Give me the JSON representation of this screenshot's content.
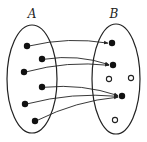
{
  "diagram": {
    "type": "function-mapping",
    "sets": [
      {
        "id": "A",
        "label": "A",
        "label_pos": [
          32,
          18
        ],
        "ellipse": {
          "cx": 32,
          "cy": 79,
          "rx": 25,
          "ry": 54
        }
      },
      {
        "id": "B",
        "label": "B",
        "label_pos": [
          114,
          18
        ],
        "ellipse": {
          "cx": 116,
          "cy": 79,
          "rx": 24,
          "ry": 55
        }
      }
    ],
    "domain_points": [
      {
        "id": "a1",
        "x": 27,
        "y": 46
      },
      {
        "id": "a2",
        "x": 42,
        "y": 59
      },
      {
        "id": "a3",
        "x": 24,
        "y": 72
      },
      {
        "id": "a4",
        "x": 42,
        "y": 87
      },
      {
        "id": "a5",
        "x": 25,
        "y": 104
      },
      {
        "id": "a6",
        "x": 35,
        "y": 121
      }
    ],
    "codomain_points": [
      {
        "id": "b1",
        "x": 112,
        "y": 43,
        "filled": true
      },
      {
        "id": "b2",
        "x": 113,
        "y": 65,
        "filled": true
      },
      {
        "id": "b3",
        "x": 109,
        "y": 79,
        "filled": false
      },
      {
        "id": "b4",
        "x": 131,
        "y": 78,
        "filled": false
      },
      {
        "id": "b5",
        "x": 122,
        "y": 96,
        "filled": true
      },
      {
        "id": "b6",
        "x": 115,
        "y": 120,
        "filled": false
      }
    ],
    "arrows": [
      {
        "from": "a1",
        "to": "b1"
      },
      {
        "from": "a2",
        "to": "b2"
      },
      {
        "from": "a3",
        "to": "b2"
      },
      {
        "from": "a4",
        "to": "b5"
      },
      {
        "from": "a5",
        "to": "b5"
      },
      {
        "from": "a6",
        "to": "b5"
      }
    ],
    "colors": {
      "stroke": "#222222",
      "fill": "#111111",
      "background": "#ffffff"
    }
  }
}
